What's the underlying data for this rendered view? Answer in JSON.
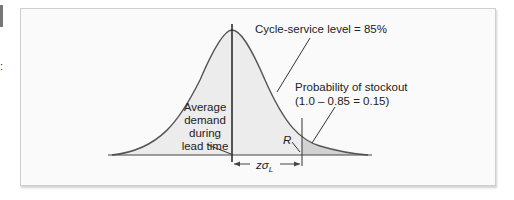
{
  "diagram": {
    "labels": {
      "cycle_service_level": "Cycle-service level = 85%",
      "probability_stockout_line1": "Probability of stockout",
      "probability_stockout_line2": "(1.0 – 0.85 = 0.15)",
      "average_demand_line1": "Average",
      "average_demand_line2": "demand",
      "average_demand_line3": "during",
      "average_demand_line4": "lead time",
      "reorder_point": "R",
      "z_sigma": "zσ",
      "z_sigma_subscript": "L"
    },
    "values": {
      "cycle_service_level_pct": 85,
      "stockout_probability": 0.15
    },
    "colors": {
      "curve": "#555555",
      "fill": "#e6e6e6",
      "stockout_fill": "#d4d4d4",
      "axis": "#444444"
    }
  }
}
